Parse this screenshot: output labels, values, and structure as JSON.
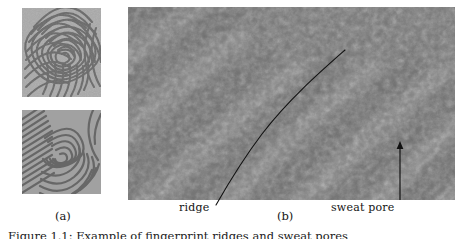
{
  "figure": {
    "panels": [
      {
        "id": "a",
        "label": "(a)",
        "description": "two stacked grayscale fingerprint images",
        "images": [
          {
            "name": "fingerprint-whorl",
            "pattern": "whorl-loop concentric ridges"
          },
          {
            "name": "fingerprint-diagonal",
            "pattern": "diagonal ridge flow with core"
          }
        ]
      },
      {
        "id": "b",
        "label": "(b)",
        "description": "magnified fingerprint region with annotations",
        "annotations": [
          {
            "name": "ridge",
            "label": "ridge",
            "type": "curve-leader"
          },
          {
            "name": "sweat-pore",
            "label": "sweat pore",
            "type": "arrow"
          }
        ]
      }
    ],
    "caption": "Figure 1.1:  Example of fingerprint ridges and sweat pores"
  },
  "colors": {
    "ink": "#141414",
    "ridge_dark": "#4a4a4a",
    "ridge_light": "#d8d8d8",
    "background": "#ffffff",
    "annotation_line": "#111111"
  }
}
